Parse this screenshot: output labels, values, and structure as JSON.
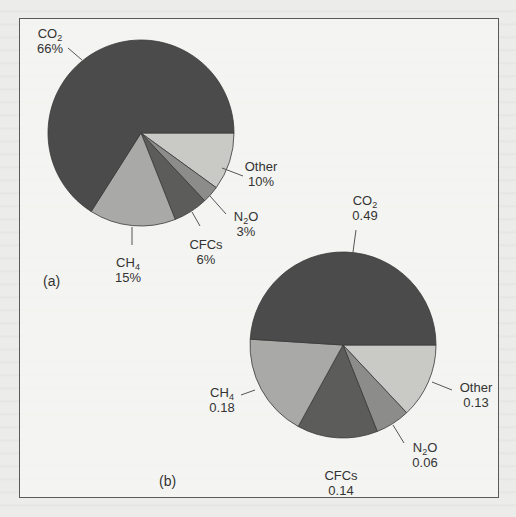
{
  "chart_data": [
    {
      "type": "pie",
      "panel_label": "(a)",
      "value_format": "percent",
      "start": "3 o'clock, clockwise",
      "slices": [
        {
          "name": "Other",
          "label": "Other",
          "value": 10,
          "value_label": "10%",
          "color": "#c9c9c6"
        },
        {
          "name": "N2O",
          "label": "N2O",
          "value": 3,
          "value_label": "3%",
          "color": "#8c8c8a"
        },
        {
          "name": "CFCs",
          "label": "CFCs",
          "value": 6,
          "value_label": "6%",
          "color": "#5c5c5b"
        },
        {
          "name": "CH4",
          "label": "CH4",
          "value": 15,
          "value_label": "15%",
          "color": "#a9a9a7"
        },
        {
          "name": "CO2",
          "label": "CO2",
          "value": 66,
          "value_label": "66%",
          "color": "#4b4b4b"
        }
      ]
    },
    {
      "type": "pie",
      "panel_label": "(b)",
      "value_format": "fraction",
      "start": "3 o'clock, clockwise",
      "slices": [
        {
          "name": "Other",
          "label": "Other",
          "value": 0.13,
          "value_label": "0.13",
          "color": "#c9c9c6"
        },
        {
          "name": "N2O",
          "label": "N2O",
          "value": 0.06,
          "value_label": "0.06",
          "color": "#8c8c8a"
        },
        {
          "name": "CFCs",
          "label": "CFCs",
          "value": 0.14,
          "value_label": "0.14",
          "color": "#5c5c5b"
        },
        {
          "name": "CH4",
          "label": "CH4",
          "value": 0.18,
          "value_label": "0.18",
          "color": "#a9a9a7"
        },
        {
          "name": "CO2",
          "label": "CO2",
          "value": 0.49,
          "value_label": "0.49",
          "color": "#4b4b4b"
        }
      ]
    }
  ],
  "figure": {
    "panel_a": {
      "label": "(a)",
      "co2": {
        "name": "CO",
        "sub": "2",
        "value": "66%"
      },
      "other": {
        "name": "Other",
        "value": "10%"
      },
      "n2o": {
        "name": "N",
        "sub": "2",
        "tail": "O",
        "value": "3%"
      },
      "cfcs": {
        "name": "CFCs",
        "value": "6%"
      },
      "ch4": {
        "name": "CH",
        "sub": "4",
        "value": "15%"
      }
    },
    "panel_b": {
      "label": "(b)",
      "co2": {
        "name": "CO",
        "sub": "2",
        "value": "0.49"
      },
      "other": {
        "name": "Other",
        "value": "0.13"
      },
      "n2o": {
        "name": "N",
        "sub": "2",
        "tail": "O",
        "value": "0.06"
      },
      "cfcs": {
        "name": "CFCs",
        "value": "0.14"
      },
      "ch4": {
        "name": "CH",
        "sub": "4",
        "value": "0.18"
      }
    }
  }
}
